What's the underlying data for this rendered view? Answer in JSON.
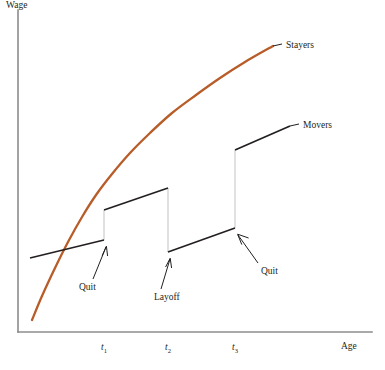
{
  "chart_data": {
    "type": "line",
    "title": "",
    "subtitle": "",
    "xlabel": "Age",
    "ylabel": "Wage",
    "grid": false,
    "legend_position": "inline-right-labels",
    "xlim": [
      0,
      100
    ],
    "ylim": [
      0,
      100
    ],
    "xticks": [
      "t1",
      "t2",
      "t3"
    ],
    "xtick_labels": [
      "t",
      "t",
      "t"
    ],
    "xtick_subscripts": [
      "1",
      "2",
      "3"
    ],
    "xtick_positions_px": [
      104,
      168,
      235
    ],
    "yticks": [],
    "series": [
      {
        "name": "Stayers",
        "type": "line",
        "color": "#b85c28",
        "style": "smooth-concave",
        "description": "Continuous concave tenure-wage profile for workers who stay with one firm",
        "points_px": [
          [
            32,
            320
          ],
          [
            42,
            296
          ],
          [
            55,
            268
          ],
          [
            68,
            242
          ],
          [
            82,
            217
          ],
          [
            96,
            195
          ],
          [
            112,
            174
          ],
          [
            130,
            153
          ],
          [
            150,
            133
          ],
          [
            172,
            113
          ],
          [
            196,
            95
          ],
          [
            220,
            78
          ],
          [
            245,
            62
          ],
          [
            273,
            46
          ]
        ]
      },
      {
        "name": "Movers",
        "type": "step-segments",
        "color": "#231f20",
        "description": "Discontinuous wage profile for workers who change firms; each segment is a job spell ending in a separation",
        "segments": [
          {
            "spell": 1,
            "start_px": [
              30,
              258
            ],
            "end_px": [
              104,
              240
            ],
            "separation": "Quit"
          },
          {
            "spell": 2,
            "start_px": [
              104,
              210
            ],
            "end_px": [
              168,
              188
            ],
            "separation": "Layoff"
          },
          {
            "spell": 3,
            "start_px": [
              168,
              252
            ],
            "end_px": [
              235,
              228
            ],
            "separation": "Quit"
          },
          {
            "spell": 4,
            "start_px": [
              235,
              150
            ],
            "end_px": [
              290,
              126
            ],
            "separation": null
          }
        ],
        "discontinuities": [
          {
            "at": "t1",
            "x_px": 104,
            "from_y_px": 240,
            "to_y_px": 210,
            "direction": "up",
            "label": "Quit"
          },
          {
            "at": "t2",
            "x_px": 168,
            "from_y_px": 188,
            "to_y_px": 252,
            "direction": "down",
            "label": "Layoff"
          },
          {
            "at": "t3",
            "x_px": 235,
            "from_y_px": 228,
            "to_y_px": 150,
            "direction": "up",
            "label": "Quit"
          }
        ]
      }
    ],
    "annotations": [
      {
        "text": "Stayers",
        "x_px": 285,
        "y_px": 48,
        "kind": "series-callout",
        "leader_from_px": [
          273,
          46
        ]
      },
      {
        "text": "Movers",
        "x_px": 302,
        "y_px": 128,
        "kind": "series-callout",
        "leader_from_px": [
          290,
          126
        ]
      },
      {
        "text": "Quit",
        "x_px": 80,
        "y_px": 287,
        "kind": "event",
        "arrow_to_px": [
          106,
          246
        ]
      },
      {
        "text": "Layoff",
        "x_px": 156,
        "y_px": 297,
        "kind": "event",
        "arrow_to_px": [
          170,
          258
        ]
      },
      {
        "text": "Quit",
        "x_px": 263,
        "y_px": 272,
        "kind": "event",
        "arrow_to_px": [
          238,
          234
        ]
      }
    ]
  },
  "axes": {
    "y_title": "Wage",
    "x_title": "Age",
    "origin_px": [
      18,
      332
    ],
    "y_top_px": 10,
    "x_right_px": 372,
    "axis_color": "#8c8c8c"
  },
  "series_labels": {
    "stayers": "Stayers",
    "movers": "Movers"
  },
  "event_labels": {
    "quit_1": "Quit",
    "layoff": "Layoff",
    "quit_2": "Quit"
  },
  "ticks": {
    "t1_base": "t",
    "t1_sub": "1",
    "t2_base": "t",
    "t2_sub": "2",
    "t3_base": "t",
    "t3_sub": "3"
  },
  "colors": {
    "stayers_curve": "#b85c28",
    "movers_line": "#231f20",
    "axis": "#8c8c8c",
    "drop_line": "#c9c9c9",
    "background": "#ffffff"
  }
}
